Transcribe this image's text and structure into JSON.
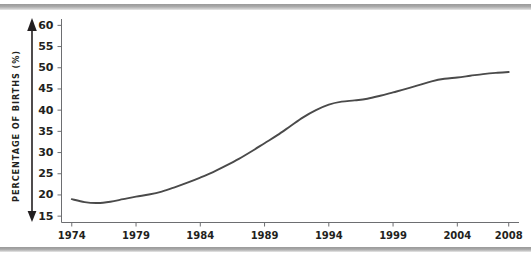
{
  "figure": {
    "background_color": "#ffffff",
    "band_color": "#a8a8a8",
    "line_color": "#4a4a4a",
    "axis_color": "#6d6e71",
    "text_color": "#231f20"
  },
  "chart_data": {
    "type": "line",
    "title": "",
    "subtitle": "",
    "xlabel": "",
    "ylabel": "PERCENTAGE OF BIRTHS (%)",
    "ylim": [
      13.5,
      61.5
    ],
    "xlim": [
      1973.2,
      2008.8
    ],
    "yticks": [
      15,
      20,
      25,
      30,
      35,
      40,
      45,
      50,
      55,
      60
    ],
    "ytick_labels": [
      "15",
      "20",
      "25",
      "30",
      "35",
      "40",
      "45",
      "50",
      "55",
      "60"
    ],
    "xticks": [
      1974,
      1979,
      1984,
      1989,
      1994,
      1999,
      2004,
      2008
    ],
    "xtick_labels": [
      "1974",
      "1979",
      "1984",
      "1989",
      "1994",
      "1999",
      "2004",
      "2008"
    ],
    "grid": false,
    "legend": null,
    "legend_position": "none",
    "annotations": [],
    "x": [
      1974,
      1975,
      1976,
      1977,
      1978,
      1979,
      1980,
      1981,
      1982,
      1983,
      1984,
      1985,
      1986,
      1987,
      1988,
      1989,
      1990,
      1991,
      1992,
      1993,
      1994,
      1995,
      1996,
      1997,
      1998,
      1999,
      2000,
      2001,
      2002,
      2003,
      2004,
      2005,
      2006,
      2007,
      2008
    ],
    "series": [
      {
        "name": "Percentage of births",
        "values": [
          19.0,
          18.3,
          18.1,
          18.4,
          19.0,
          19.6,
          20.1,
          20.8,
          21.8,
          22.9,
          24.1,
          25.4,
          26.9,
          28.5,
          30.3,
          32.2,
          34.1,
          36.2,
          38.3,
          40.0,
          41.3,
          42.0,
          42.3,
          42.7,
          43.4,
          44.2,
          45.0,
          45.9,
          46.8,
          47.4,
          47.7,
          48.1,
          48.5,
          48.8,
          49.0
        ]
      }
    ]
  }
}
